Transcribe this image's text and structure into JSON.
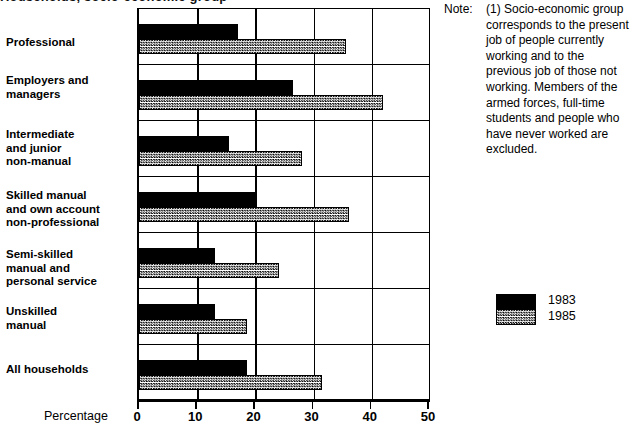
{
  "title_partial": "Households, socio-economic group",
  "axis": {
    "xlabel": "Percentage",
    "ticks": [
      "0",
      "10",
      "20",
      "30",
      "40",
      "50"
    ]
  },
  "note": {
    "label": "Note:",
    "text": "(1) Socio-economic group corresponds to the present job of people currently working and to the previous job of those not working. Members of the armed forces, full-time students and people who have never worked are excluded."
  },
  "legend": {
    "items": [
      {
        "label": "1983",
        "color": "#000000"
      },
      {
        "label": "1985",
        "color": "#a8a8a8"
      }
    ]
  },
  "categories": [
    "Professional",
    "Employers and\nmanagers",
    "Intermediate\nand junior\nnon-manual",
    "Skilled manual\nand own account\nnon-professional",
    "Semi-skilled\nmanual and\npersonal service",
    "Unskilled\nmanual",
    "All households"
  ],
  "chart_data": {
    "type": "bar",
    "orientation": "horizontal",
    "title": "Households, socio-economic group",
    "xlabel": "Percentage",
    "ylabel": "",
    "xlim": [
      0,
      50
    ],
    "grid": true,
    "legend_position": "right",
    "categories": [
      "Professional",
      "Employers and managers",
      "Intermediate and junior non-manual",
      "Skilled manual and own account non-professional",
      "Semi-skilled manual and personal service",
      "Unskilled manual",
      "All households"
    ],
    "series": [
      {
        "name": "1983",
        "color": "#000000",
        "values": [
          17,
          26.5,
          15.5,
          20,
          13,
          13,
          18.5
        ]
      },
      {
        "name": "1985",
        "color": "#a8a8a8",
        "values": [
          35.5,
          42,
          28,
          36,
          24,
          18.5,
          31.5
        ]
      }
    ],
    "annotations": [
      "(1) Socio-economic group corresponds to the present job of people currently working and to the previous job of those not working. Members of the armed forces, full-time students and people who have never worked are excluded."
    ]
  }
}
